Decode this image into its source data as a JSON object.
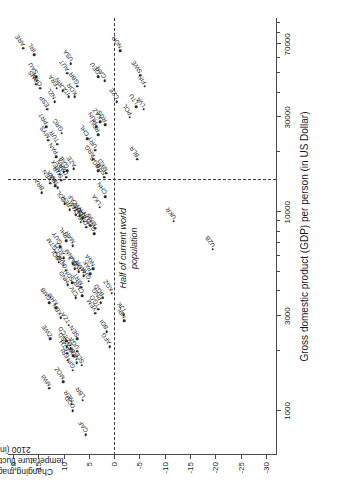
{
  "chart_data": {
    "type": "scatter",
    "title": "",
    "xlabel": "Gross domestic product (GDP) per person (in US Dollar)",
    "ylabel": "Changing magnitude of temperature fluctuations until 2100 (in %)",
    "xscale": "log",
    "xlim": [
      600,
      95000
    ],
    "ylim": [
      -32,
      21
    ],
    "xticks": [
      1000,
      3000,
      10000,
      30000,
      70000
    ],
    "xticklabels": [
      "1000",
      "3000",
      "10000",
      "30000",
      "70000"
    ],
    "yticks": [
      20,
      15,
      10,
      5,
      0,
      -5,
      -10,
      -15,
      -20,
      -25,
      -30
    ],
    "yticklabels": [
      "20",
      "15",
      "10",
      "5",
      "0",
      "-5",
      "-10",
      "-15",
      "-20",
      "-25",
      "-30"
    ],
    "grid": false,
    "legend": null,
    "annotations": [
      {
        "name": "half-population-line",
        "text": "Half of current world population",
        "type": "vline",
        "x": 14500
      },
      {
        "name": "zero-line",
        "text": "",
        "type": "hline",
        "y": 0
      }
    ],
    "points": [
      {
        "label": "CAF",
        "x": 760,
        "y": 5.6
      },
      {
        "label": "COD",
        "x": 1000,
        "y": 8.2
      },
      {
        "label": "NER",
        "x": 1080,
        "y": 8.4
      },
      {
        "label": "LBR",
        "x": 1130,
        "y": 6.2
      },
      {
        "label": "MWI",
        "x": 1300,
        "y": 12.9
      },
      {
        "label": "MOZ",
        "x": 1400,
        "y": 10.1
      },
      {
        "label": "GIN",
        "x": 1600,
        "y": 8.2
      },
      {
        "label": "SLE",
        "x": 1700,
        "y": 6.4
      },
      {
        "label": "MDG",
        "x": 1750,
        "y": 7.4
      },
      {
        "label": "UGA",
        "x": 2000,
        "y": 7.3
      },
      {
        "label": "SEN",
        "x": 2300,
        "y": 7.3
      },
      {
        "label": "BFA",
        "x": 1900,
        "y": 8.1
      },
      {
        "label": "MLI",
        "x": 2050,
        "y": 8.6
      },
      {
        "label": "ERI",
        "x": 1800,
        "y": 9.2
      },
      {
        "label": "ETH",
        "x": 1950,
        "y": 9.3
      },
      {
        "label": "SSD",
        "x": 2100,
        "y": 9.4
      },
      {
        "label": "TCD",
        "x": 2250,
        "y": 9.5
      },
      {
        "label": "ZWE",
        "x": 2300,
        "y": 12.7
      },
      {
        "label": "AFG",
        "x": 2100,
        "y": 0.9
      },
      {
        "label": "BDI",
        "x": 2500,
        "y": 1.5
      },
      {
        "label": "NPL",
        "x": 2850,
        "y": -2.0
      },
      {
        "label": "TJK",
        "x": 3050,
        "y": -1.9
      },
      {
        "label": "TZA",
        "x": 2700,
        "y": 9.0
      },
      {
        "label": "KEN",
        "x": 2950,
        "y": 10.6
      },
      {
        "label": "KHM",
        "x": 3300,
        "y": 11.5
      },
      {
        "label": "GMB",
        "x": 3500,
        "y": 12.9
      },
      {
        "label": "YEM",
        "x": 3100,
        "y": 3.7
      },
      {
        "label": "TGO",
        "x": 3250,
        "y": 3.2
      },
      {
        "label": "PNG",
        "x": 3500,
        "y": 2.7
      },
      {
        "label": "BGD",
        "x": 3700,
        "y": 2.3
      },
      {
        "label": "KGZ",
        "x": 3900,
        "y": 0.5
      },
      {
        "label": "CIV",
        "x": 3700,
        "y": 7.6
      },
      {
        "label": "CMR",
        "x": 3800,
        "y": 6.3
      },
      {
        "label": "MRT",
        "x": 4200,
        "y": 6.5
      },
      {
        "label": "GHA",
        "x": 4500,
        "y": 5.0
      },
      {
        "label": "PAK",
        "x": 4900,
        "y": 4.8
      },
      {
        "label": "NGA",
        "x": 5200,
        "y": 4.2
      },
      {
        "label": "MMR",
        "x": 4800,
        "y": 6.0
      },
      {
        "label": "SDN",
        "x": 4400,
        "y": 8.3
      },
      {
        "label": "HND",
        "x": 4300,
        "y": 9.2
      },
      {
        "label": "IND",
        "x": 5000,
        "y": 7.0
      },
      {
        "label": "BLZ",
        "x": 5200,
        "y": 7.8
      },
      {
        "label": "VNM",
        "x": 5500,
        "y": 8.2
      },
      {
        "label": "COG",
        "x": 5100,
        "y": 9.6
      },
      {
        "label": "LAO",
        "x": 5400,
        "y": 10.0
      },
      {
        "label": "AGO",
        "x": 5900,
        "y": 10.0
      },
      {
        "label": "BOL",
        "x": 5600,
        "y": 11.0
      },
      {
        "label": "GTM",
        "x": 6300,
        "y": 11.6
      },
      {
        "label": "GUY",
        "x": 6700,
        "y": 10.7
      },
      {
        "label": "MAR",
        "x": 6800,
        "y": 8.2
      },
      {
        "label": "PHL",
        "x": 7200,
        "y": 9.5
      },
      {
        "label": "GEO",
        "x": 7800,
        "y": 3.9
      },
      {
        "label": "MNG",
        "x": 8300,
        "y": 3.8
      },
      {
        "label": "TUN",
        "x": 8600,
        "y": 4.7
      },
      {
        "label": "DJI",
        "x": 8400,
        "y": 5.5
      },
      {
        "label": "ECU",
        "x": 9000,
        "y": 6.0
      },
      {
        "label": "IDN",
        "x": 9600,
        "y": 6.8
      },
      {
        "label": "EGY",
        "x": 8900,
        "y": 6.6
      },
      {
        "label": "PRY",
        "x": 9400,
        "y": 6.2
      },
      {
        "label": "JAM",
        "x": 9700,
        "y": 7.6
      },
      {
        "label": "ZAF",
        "x": 10600,
        "y": 7.8
      },
      {
        "label": "PER",
        "x": 10300,
        "y": 8.8
      },
      {
        "label": "COL",
        "x": 11000,
        "y": 9.8
      },
      {
        "label": "LKA",
        "x": 10600,
        "y": 2.9
      },
      {
        "label": "CHN",
        "x": 12000,
        "y": 1.8
      },
      {
        "label": "BRA",
        "x": 12500,
        "y": 14.3
      },
      {
        "label": "THA",
        "x": 13300,
        "y": 11.2
      },
      {
        "label": "BWA",
        "x": 13600,
        "y": 11.7
      },
      {
        "label": "VEN",
        "x": 14000,
        "y": 12.6
      },
      {
        "label": "SUR",
        "x": 14500,
        "y": 10.5
      },
      {
        "label": "MEX",
        "x": 15500,
        "y": 10.8
      },
      {
        "label": "DZA",
        "x": 15000,
        "y": 9.5
      },
      {
        "label": "GAB",
        "x": 16200,
        "y": 9.3
      },
      {
        "label": "IRN",
        "x": 16000,
        "y": 10.0
      },
      {
        "label": "AZE",
        "x": 16500,
        "y": 8.0
      },
      {
        "label": "PAN",
        "x": 19000,
        "y": 11.5
      },
      {
        "label": "MYS",
        "x": 23000,
        "y": 13.0
      },
      {
        "label": "PRT",
        "x": 27000,
        "y": 13.4
      },
      {
        "label": "ESP",
        "x": 33000,
        "y": 13.2
      },
      {
        "label": "OMN",
        "x": 42000,
        "y": 14.6
      },
      {
        "label": "AUS",
        "x": 44000,
        "y": 15.4
      },
      {
        "label": "SAU",
        "x": 48000,
        "y": 15.4
      },
      {
        "label": "ARE",
        "x": 67000,
        "y": 18.0
      },
      {
        "label": "SRB",
        "x": 15000,
        "y": 2.0
      },
      {
        "label": "BGR",
        "x": 16200,
        "y": 3.2
      },
      {
        "label": "MKD",
        "x": 15700,
        "y": 1.6
      },
      {
        "label": "ARG",
        "x": 18500,
        "y": 4.2
      },
      {
        "label": "URY",
        "x": 20500,
        "y": 3.7
      },
      {
        "label": "TUR",
        "x": 22000,
        "y": 11.3
      },
      {
        "label": "GRC",
        "x": 25000,
        "y": 10.4
      },
      {
        "label": "CHL",
        "x": 23500,
        "y": 5.3
      },
      {
        "label": "ROU",
        "x": 24500,
        "y": 3.2
      },
      {
        "label": "BLR",
        "x": 18500,
        "y": -4.5
      },
      {
        "label": "HUN",
        "x": 27000,
        "y": 3.5
      },
      {
        "label": "KAZ",
        "x": 28500,
        "y": 2.8
      },
      {
        "label": "RUS",
        "x": 27500,
        "y": 1.8
      },
      {
        "label": "POL",
        "x": 30000,
        "y": -3.1
      },
      {
        "label": "LTU",
        "x": 34000,
        "y": -4.4
      },
      {
        "label": "LVA",
        "x": 33000,
        "y": -5.8
      },
      {
        "label": "CZE",
        "x": 36000,
        "y": -0.5
      },
      {
        "label": "NZL",
        "x": 36000,
        "y": 11.8
      },
      {
        "label": "ITA",
        "x": 38000,
        "y": 9.0
      },
      {
        "label": "KOR",
        "x": 38000,
        "y": 7.8
      },
      {
        "label": "JPN",
        "x": 41000,
        "y": 10.2
      },
      {
        "label": "FRA",
        "x": 42000,
        "y": 11.4
      },
      {
        "label": "GBR",
        "x": 43000,
        "y": 7.3
      },
      {
        "label": "IRL",
        "x": 62000,
        "y": 15.8
      },
      {
        "label": "AUT",
        "x": 50000,
        "y": 9.3
      },
      {
        "label": "USA",
        "x": 56000,
        "y": 8.6
      },
      {
        "label": "DEU",
        "x": 48000,
        "y": 3.2
      },
      {
        "label": "CAN",
        "x": 46000,
        "y": 1.9
      },
      {
        "label": "FIN",
        "x": 43000,
        "y": -6.0
      },
      {
        "label": "SWE",
        "x": 49000,
        "y": -5.2
      },
      {
        "label": "NOR",
        "x": 65000,
        "y": -1.2
      },
      {
        "label": "UKR",
        "x": 9000,
        "y": -11.8
      },
      {
        "label": "UZB",
        "x": 6500,
        "y": -19.5
      }
    ]
  }
}
